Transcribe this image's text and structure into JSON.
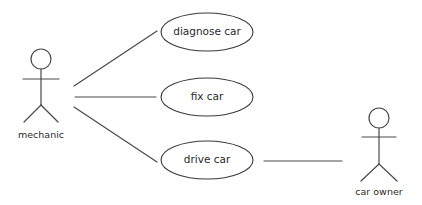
{
  "diagram": {
    "type": "uml-use-case",
    "actors": [
      {
        "id": "mechanic",
        "label": "mechanic"
      },
      {
        "id": "car-owner",
        "label": "car owner"
      }
    ],
    "use_cases": [
      {
        "id": "diagnose-car",
        "label": "diagnose car"
      },
      {
        "id": "fix-car",
        "label": "fix car"
      },
      {
        "id": "drive-car",
        "label": "drive car"
      }
    ],
    "associations": [
      {
        "from": "mechanic",
        "to": "diagnose-car"
      },
      {
        "from": "mechanic",
        "to": "fix-car"
      },
      {
        "from": "mechanic",
        "to": "drive-car"
      },
      {
        "from": "drive-car",
        "to": "car-owner"
      }
    ],
    "colors": {
      "line": "#4a4a4a",
      "text": "#2a2a2a",
      "background": "#ffffff"
    }
  }
}
